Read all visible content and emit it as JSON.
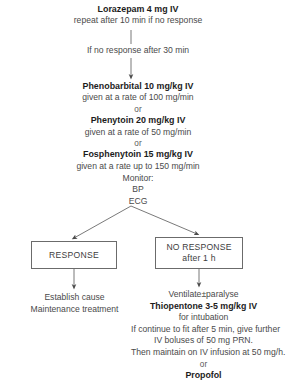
{
  "diagram": {
    "line_color": "#5a5a5a",
    "text_color": "#4a4a4a",
    "bold_text_color": "#1c1c1c",
    "box_border_color": "#6b6b6b",
    "background": "#ffffff"
  },
  "top": {
    "drug": "Lorazepam 4 mg IV",
    "instruction": "repeat after 10 min if no response"
  },
  "connector_label": {
    "no_response_30": "If no response after 30 min"
  },
  "regimen": {
    "phenobarbital": {
      "drug": "Phenobarbital  10 mg/kg IV",
      "rate": "given at a rate of 100 mg/min"
    },
    "or_1": "or",
    "phenytoin": {
      "drug": "Phenytoin 20 mg/kg IV",
      "rate": "given at a rate of 50 mg/min"
    },
    "or_2": "or",
    "fosphenytoin": {
      "drug": "Fosphenytoin 15 mg/kg IV",
      "rate": "given at a rate up to 150 mg/min"
    }
  },
  "monitor": {
    "heading": "Monitor:",
    "items": [
      "BP",
      "ECG"
    ]
  },
  "branches": {
    "response": {
      "label": "RESPONSE"
    },
    "no_response": {
      "label": "NO RESPONSE",
      "sublabel": "after 1 h"
    }
  },
  "outcomes": {
    "response": {
      "lines": [
        "Establish cause",
        "Maintenance treatment"
      ]
    },
    "no_response": {
      "line_1": "Ventilate±paralyse",
      "drug": "Thiopentone 3-5 mg/kg IV",
      "line_2": "for intubation",
      "line_3": "If continue to fit after 5 min, give further",
      "line_4": "IV boluses of 50 mg PRN.",
      "line_5": "Then maintain on IV infusion at 50 mg/h.",
      "or": "or",
      "alternative_drug": "Propofol"
    }
  }
}
